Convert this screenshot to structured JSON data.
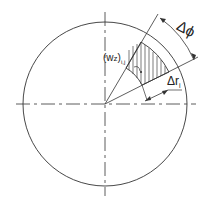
{
  "diagram": {
    "type": "polar-grid-cell",
    "labels": {
      "cell_value": "(w",
      "cell_value_sub": "z",
      "cell_value_close": ")",
      "cell_index": "i,j",
      "delta_phi": "Δϕ",
      "delta_r": "Δr",
      "delta_r_sub": "i"
    },
    "colors": {
      "line": "#333333",
      "background": "#ffffff"
    }
  }
}
